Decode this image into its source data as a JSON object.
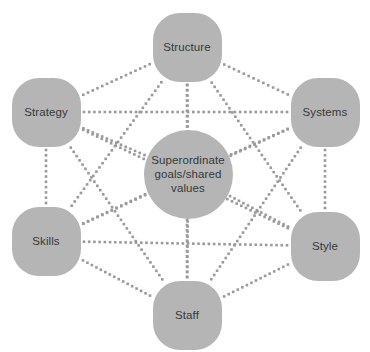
{
  "diagram": {
    "type": "network-mesh",
    "background_color": "#ffffff",
    "node_fill_color": "#b5b5b5",
    "node_text_color": "#35383b",
    "edge_color": "#9a9a9a",
    "edge_style": "dotted",
    "nodes": [
      {
        "id": "structure",
        "label": "Structure",
        "x": 187,
        "y": 47,
        "shape": "squircle",
        "role": "outer"
      },
      {
        "id": "strategy",
        "label": "Strategy",
        "x": 46,
        "y": 112,
        "shape": "squircle",
        "role": "outer"
      },
      {
        "id": "systems",
        "label": "Systems",
        "x": 325,
        "y": 112,
        "shape": "squircle",
        "role": "outer"
      },
      {
        "id": "shared",
        "label": "Superordinate\ngoals/shared\nvalues",
        "x": 188,
        "y": 174,
        "shape": "circle",
        "role": "center"
      },
      {
        "id": "skills",
        "label": "Skills",
        "x": 46,
        "y": 241,
        "shape": "squircle",
        "role": "outer"
      },
      {
        "id": "style",
        "label": "Style",
        "x": 325,
        "y": 246,
        "shape": "squircle",
        "role": "outer"
      },
      {
        "id": "staff",
        "label": "Staff",
        "x": 187,
        "y": 315,
        "shape": "squircle",
        "role": "outer"
      }
    ],
    "edges": [
      [
        "structure",
        "strategy"
      ],
      [
        "structure",
        "systems"
      ],
      [
        "structure",
        "shared"
      ],
      [
        "structure",
        "skills"
      ],
      [
        "structure",
        "style"
      ],
      [
        "structure",
        "staff"
      ],
      [
        "strategy",
        "systems"
      ],
      [
        "strategy",
        "shared"
      ],
      [
        "strategy",
        "skills"
      ],
      [
        "strategy",
        "style"
      ],
      [
        "strategy",
        "staff"
      ],
      [
        "systems",
        "shared"
      ],
      [
        "systems",
        "skills"
      ],
      [
        "systems",
        "style"
      ],
      [
        "systems",
        "staff"
      ],
      [
        "shared",
        "skills"
      ],
      [
        "shared",
        "style"
      ],
      [
        "shared",
        "staff"
      ],
      [
        "skills",
        "style"
      ],
      [
        "skills",
        "staff"
      ],
      [
        "style",
        "staff"
      ]
    ]
  }
}
